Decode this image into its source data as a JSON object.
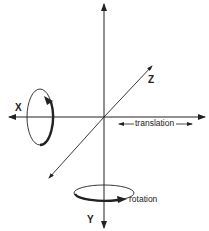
{
  "diagram": {
    "axes": {
      "x": {
        "label": "X"
      },
      "y": {
        "label": "Y"
      },
      "z": {
        "label": "Z"
      }
    },
    "annotations": {
      "translation": "translation",
      "rotation": "rotation"
    },
    "colors": {
      "ink": "#222222",
      "background": "#ffffff"
    }
  }
}
